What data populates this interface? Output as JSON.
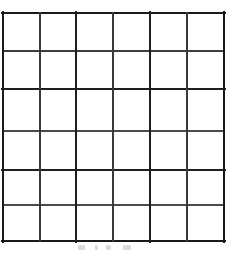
{
  "figure": {
    "type": "grid-diagram",
    "title": "",
    "caption": "",
    "background_color": "#ffffff"
  },
  "grid": {
    "columns": 6,
    "rows": 6,
    "total_cells": 36,
    "cell_contents": [
      [
        "",
        "",
        "",
        "",
        "",
        ""
      ],
      [
        "",
        "",
        "",
        "",
        "",
        ""
      ],
      [
        "",
        "",
        "",
        "",
        "",
        ""
      ],
      [
        "",
        "",
        "",
        "",
        "",
        ""
      ],
      [
        "",
        "",
        "",
        "",
        "",
        ""
      ],
      [
        "",
        "",
        "",
        "",
        "",
        ""
      ]
    ],
    "geometry": {
      "left": 3,
      "top": 13,
      "right": 224,
      "bottom": 241,
      "width": 221,
      "height": 228,
      "cell_width": 36.8,
      "cell_height": 38.0,
      "vertical_line_x": [
        3,
        40,
        76,
        113,
        150,
        187,
        224
      ],
      "horizontal_line_y": [
        13,
        51,
        89,
        131,
        170,
        205,
        241
      ]
    },
    "stroke": {
      "color_dark": "#1a1a1a",
      "color_medium": "#333333",
      "color_light": "#4d4d4d",
      "width_thick": 2.6,
      "width_normal": 1.9,
      "width_thin": 1.4
    },
    "fill_color": "#ffffff"
  },
  "vertical_lines": [
    {
      "x": 3,
      "stroke": "#1a1a1a",
      "width": 2.4
    },
    {
      "x": 40,
      "stroke": "#3a3a3a",
      "width": 1.6
    },
    {
      "x": 76,
      "stroke": "#1f1f1f",
      "width": 2.4
    },
    {
      "x": 113,
      "stroke": "#3a3a3a",
      "width": 1.7
    },
    {
      "x": 150,
      "stroke": "#1f1f1f",
      "width": 2.4
    },
    {
      "x": 187,
      "stroke": "#3a3a3a",
      "width": 1.7
    },
    {
      "x": 224,
      "stroke": "#1a1a1a",
      "width": 2.4
    }
  ],
  "horizontal_lines": [
    {
      "y": 13,
      "stroke": "#1a1a1a",
      "width": 2.4
    },
    {
      "y": 51,
      "stroke": "#3d3d3d",
      "width": 1.5
    },
    {
      "y": 89,
      "stroke": "#1f1f1f",
      "width": 2.4
    },
    {
      "y": 131,
      "stroke": "#4a4a4a",
      "width": 1.4
    },
    {
      "y": 170,
      "stroke": "#1f1f1f",
      "width": 2.3
    },
    {
      "y": 205,
      "stroke": "#4a4a4a",
      "width": 1.4
    },
    {
      "y": 241,
      "stroke": "#1a1a1a",
      "width": 2.4
    }
  ]
}
